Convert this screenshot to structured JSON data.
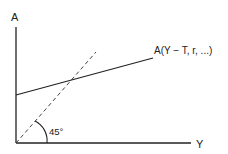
{
  "diagram": {
    "y_axis_label": "A",
    "x_axis_label": "Y",
    "curve_label": "A(Y − T, r, ...)",
    "angle_label": "45°",
    "colors": {
      "line": "#222222",
      "background": "#ffffff"
    }
  }
}
